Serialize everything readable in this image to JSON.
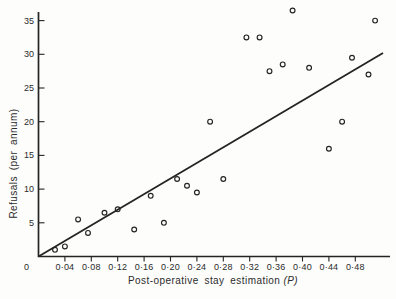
{
  "figure": {
    "background_color": "#fdfdfc",
    "ink_color": "#242424",
    "marker": "open-circle"
  },
  "chart_data": {
    "type": "scatter",
    "title": "",
    "xlabel": "Post-operative stay estimation",
    "xlabel_suffix": "(P)",
    "ylabel": "Refusals (per annum)",
    "xlim": [
      0,
      0.533
    ],
    "ylim": [
      0,
      36.8
    ],
    "grid": false,
    "legend": null,
    "origin_label": "0",
    "x_ticks": [
      0.04,
      0.08,
      0.12,
      0.16,
      0.2,
      0.24,
      0.28,
      0.32,
      0.36,
      0.4,
      0.44,
      0.48
    ],
    "x_tick_labels": [
      "0·04",
      "0·08",
      "0·12",
      "0·16",
      "0·20",
      "0·24",
      "0·28",
      "0·32",
      "0·36",
      "0·40",
      "0·44",
      "0·48"
    ],
    "y_ticks": [
      5,
      10,
      15,
      20,
      25,
      30,
      35
    ],
    "y_tick_labels": [
      "5",
      "10",
      "15",
      "20",
      "25",
      "30",
      "35"
    ],
    "points": [
      [
        0.025,
        1
      ],
      [
        0.04,
        1.5
      ],
      [
        0.06,
        5.5
      ],
      [
        0.075,
        3.5
      ],
      [
        0.1,
        6.5
      ],
      [
        0.12,
        7
      ],
      [
        0.145,
        4
      ],
      [
        0.17,
        9
      ],
      [
        0.19,
        5
      ],
      [
        0.21,
        11.5
      ],
      [
        0.225,
        10.5
      ],
      [
        0.24,
        9.5
      ],
      [
        0.26,
        20
      ],
      [
        0.28,
        11.5
      ],
      [
        0.315,
        32.5
      ],
      [
        0.335,
        32.5
      ],
      [
        0.35,
        27.5
      ],
      [
        0.37,
        28.5
      ],
      [
        0.385,
        36.5
      ],
      [
        0.41,
        28
      ],
      [
        0.44,
        16
      ],
      [
        0.46,
        20
      ],
      [
        0.475,
        29.5
      ],
      [
        0.5,
        27
      ],
      [
        0.51,
        35
      ]
    ],
    "trend_line": {
      "x": [
        0,
        0.522
      ],
      "y": [
        0,
        30.2
      ]
    }
  }
}
